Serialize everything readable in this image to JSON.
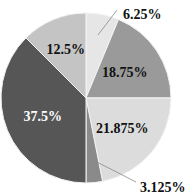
{
  "chart_data": {
    "type": "pie",
    "title": "",
    "start": "top",
    "direction": "clockwise",
    "slices": [
      {
        "label": "6.25%",
        "value": 6.25,
        "color": "#e6e6e6",
        "label_color": "#111111",
        "label_outside": true
      },
      {
        "label": "18.75%",
        "value": 18.75,
        "color": "#9a9a9a",
        "label_color": "#111111",
        "label_outside": false
      },
      {
        "label": "21.875%",
        "value": 21.875,
        "color": "#dcdcdc",
        "label_color": "#111111",
        "label_outside": false
      },
      {
        "label": "3.125%",
        "value": 3.125,
        "color": "#8a8a8a",
        "label_color": "#111111",
        "label_outside": true
      },
      {
        "label": "37.5%",
        "value": 37.5,
        "color": "#565656",
        "label_color": "#ffffff",
        "label_outside": false
      },
      {
        "label": "12.5%",
        "value": 12.5,
        "color": "#c4c4c4",
        "label_color": "#111111",
        "label_outside": false
      }
    ]
  }
}
